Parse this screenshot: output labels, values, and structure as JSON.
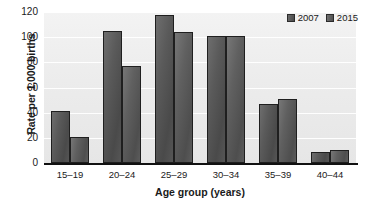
{
  "chart_data": {
    "type": "bar",
    "title": "",
    "subtitle": "",
    "xlabel": "Age group (years)",
    "ylabel": "Rate per 1,000 births",
    "categories": [
      "15–19",
      "20–24",
      "25–29",
      "30–34",
      "35–39",
      "40–44"
    ],
    "series": [
      {
        "name": "2007",
        "values": [
          41,
          105,
          118,
          101,
          47,
          9
        ],
        "color": "#4f4f4f"
      },
      {
        "name": "2015",
        "values": [
          21,
          77,
          104,
          101,
          51,
          10.5
        ],
        "color": "#585858"
      }
    ],
    "ylim": [
      0,
      120
    ],
    "ytick_labels": [
      "120",
      "100",
      "80",
      "60",
      "40",
      "20",
      "0"
    ],
    "ytick_values": [
      120,
      100,
      80,
      60,
      40,
      20,
      0
    ],
    "grid": true,
    "grid_axis": "y",
    "legend_position": "top-right",
    "bar_orientation": "vertical",
    "plot_background": "#ececec",
    "gridline_color": "#ffffff",
    "axis_color": "#111111"
  },
  "legend": {
    "items": [
      {
        "label": "2007",
        "swatch": "legend-swatch-2007"
      },
      {
        "label": "2015",
        "swatch": "legend-swatch-2015"
      }
    ]
  },
  "axes": {
    "y": {
      "title": "Rate per 1,000 births",
      "ticks": [
        "120",
        "100",
        "80",
        "60",
        "40",
        "20",
        "0"
      ]
    },
    "x": {
      "title": "Age group (years)",
      "ticks": [
        "15–19",
        "20–24",
        "25–29",
        "30–34",
        "35–39",
        "40–44"
      ]
    }
  }
}
